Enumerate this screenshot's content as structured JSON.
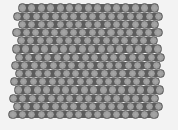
{
  "image": {
    "description": "Grayscale micrograph of hexagonally close-packed spherical particles",
    "background_color": "#f3f3f3",
    "gap_color": "#5c5c5c",
    "ball_color": "#9c9c9c",
    "ball_edge_color": "#707070",
    "ball_highlight": "#a8a8a8"
  },
  "lattice": {
    "rows": 14,
    "row_pitch": 8.2,
    "col_pitch": 9.4,
    "diameter": 9.2,
    "first_row_y": 8,
    "rows_spec": [
      {
        "x0": 22.5,
        "n": 15
      },
      {
        "x0": 17.5,
        "n": 16
      },
      {
        "x0": 22.5,
        "n": 15
      },
      {
        "x0": 17.0,
        "n": 16
      },
      {
        "x0": 21.5,
        "n": 15
      },
      {
        "x0": 16.5,
        "n": 16
      },
      {
        "x0": 19.5,
        "n": 16
      },
      {
        "x0": 15.5,
        "n": 16
      },
      {
        "x0": 19.5,
        "n": 16
      },
      {
        "x0": 14.5,
        "n": 16
      },
      {
        "x0": 18.5,
        "n": 16
      },
      {
        "x0": 13.5,
        "n": 16
      },
      {
        "x0": 17.5,
        "n": 16
      },
      {
        "x0": 13.0,
        "n": 16
      }
    ]
  }
}
